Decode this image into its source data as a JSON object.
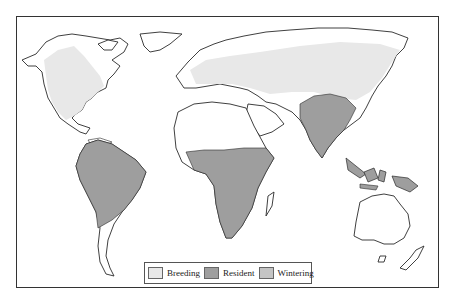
{
  "map": {
    "type": "world-distribution-map",
    "projection": "world outline",
    "colors": {
      "land": "#ffffff",
      "coastline": "#2a2a2a",
      "breeding": "#e8e8e8",
      "resident": "#9e9e9e",
      "wintering": "#c4c4c4"
    },
    "regions": [
      {
        "name": "North America (west & central)",
        "category": "breeding"
      },
      {
        "name": "Europe & northern Asia",
        "category": "breeding"
      },
      {
        "name": "South America (north & central)",
        "category": "resident"
      },
      {
        "name": "Sub-Saharan Africa",
        "category": "resident"
      },
      {
        "name": "Indian subcontinent & Southeast Asia",
        "category": "resident"
      },
      {
        "name": "Indonesia & New Guinea",
        "category": "resident"
      }
    ]
  },
  "legend": {
    "items": [
      {
        "label": "Breeding",
        "color": "#e8e8e8"
      },
      {
        "label": "Resident",
        "color": "#9e9e9e"
      },
      {
        "label": "Wintering",
        "color": "#c4c4c4"
      }
    ]
  }
}
